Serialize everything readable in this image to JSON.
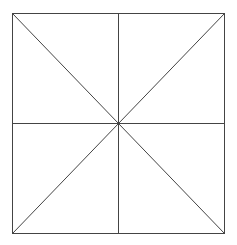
{
  "diagram": {
    "type": "geometric-figure",
    "shape": "square",
    "bounds": {
      "x1": 12,
      "y1": 13,
      "x2": 224,
      "y2": 233
    },
    "center": {
      "x": 118,
      "y": 123
    },
    "stroke_color": "#444444",
    "stroke_width": 1,
    "background": "#ffffff",
    "lines": [
      {
        "name": "vertical-midline",
        "x1": 118,
        "y1": 13,
        "x2": 118,
        "y2": 233
      },
      {
        "name": "horizontal-midline",
        "x1": 12,
        "y1": 123,
        "x2": 224,
        "y2": 123
      },
      {
        "name": "diagonal-tl-br",
        "x1": 12,
        "y1": 13,
        "x2": 224,
        "y2": 233
      },
      {
        "name": "diagonal-tr-bl",
        "x1": 224,
        "y1": 13,
        "x2": 12,
        "y2": 233
      }
    ]
  }
}
